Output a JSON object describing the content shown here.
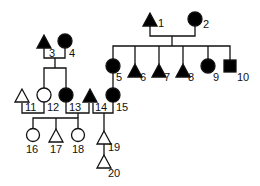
{
  "individuals": [
    {
      "id": "1",
      "label": "1",
      "shape": "triangle",
      "affected": true
    },
    {
      "id": "2",
      "label": "2",
      "shape": "circle",
      "affected": true
    },
    {
      "id": "3",
      "label": "3",
      "shape": "triangle",
      "affected": true
    },
    {
      "id": "4",
      "label": "4",
      "shape": "circle",
      "affected": true
    },
    {
      "id": "5",
      "label": "5",
      "shape": "circle",
      "affected": true
    },
    {
      "id": "6",
      "label": "6",
      "shape": "triangle",
      "affected": true
    },
    {
      "id": "7",
      "label": "7",
      "shape": "triangle",
      "affected": true
    },
    {
      "id": "8",
      "label": "8",
      "shape": "triangle",
      "affected": true
    },
    {
      "id": "9",
      "label": "9",
      "shape": "circle",
      "affected": true
    },
    {
      "id": "10",
      "label": "10",
      "shape": "square",
      "affected": true
    },
    {
      "id": "11",
      "label": "11",
      "shape": "triangle",
      "affected": false
    },
    {
      "id": "12",
      "label": "12",
      "shape": "circle",
      "affected": false
    },
    {
      "id": "13",
      "label": "13",
      "shape": "circle",
      "affected": true
    },
    {
      "id": "14",
      "label": "14",
      "shape": "triangle",
      "affected": true
    },
    {
      "id": "15",
      "label": "15",
      "shape": "circle",
      "affected": true
    },
    {
      "id": "16",
      "label": "16",
      "shape": "circle",
      "affected": false
    },
    {
      "id": "17",
      "label": "17",
      "shape": "triangle",
      "affected": false
    },
    {
      "id": "18",
      "label": "18",
      "shape": "circle",
      "affected": false
    },
    {
      "id": "19",
      "label": "19",
      "shape": "triangle",
      "affected": false
    },
    {
      "id": "20",
      "label": "20",
      "shape": "triangle",
      "affected": false
    }
  ],
  "couples": [
    [
      "1",
      "2"
    ],
    [
      "3",
      "4"
    ],
    [
      "11",
      "12"
    ],
    [
      "13",
      "14"
    ],
    [
      "14",
      "15"
    ]
  ],
  "children": {
    "1+2": [
      "5",
      "6",
      "7",
      "8",
      "9",
      "10"
    ],
    "3+4": [
      "12",
      "13"
    ],
    "13+14": [
      "16",
      "17",
      "18"
    ],
    "14+15": [
      "19"
    ],
    "19": [
      "20"
    ]
  },
  "colors": {
    "affected": "#000000",
    "unaffected": "#ffffff",
    "line": "#111111"
  }
}
